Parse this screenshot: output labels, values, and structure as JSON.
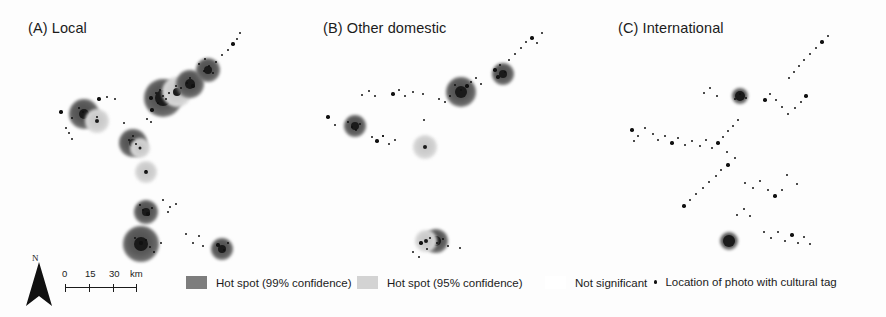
{
  "figure": {
    "type": "multi-panel-choropleth-hotspot-map",
    "panel_count": 3,
    "width": 886,
    "height": 317
  },
  "panels": [
    {
      "id": "A",
      "title": "(A) Local"
    },
    {
      "id": "B",
      "title": "(B) Other domestic"
    },
    {
      "id": "C",
      "title": "(C) International"
    }
  ],
  "north_arrow": {
    "label": "N"
  },
  "scale_bar": {
    "ticks": [
      "0",
      "15",
      "30"
    ],
    "unit": "km",
    "t0": "0",
    "t1": "15",
    "t2": "30"
  },
  "legend": {
    "hot99": "Hot spot (99% confidence)",
    "hot95": "Hot spot (95% confidence)",
    "not_significant": "Not significant",
    "photo_location": "Location of photo with cultural tag"
  },
  "colors": {
    "hot99": "#7d7d7d",
    "hot95": "#d3d3d3",
    "not_significant": "#ffffff",
    "point": "#111111",
    "text": "#1b1b1b",
    "background": "#fdfdfd"
  },
  "chart_data": {
    "type": "scatter",
    "xlabel": "",
    "ylabel": "",
    "legend_position": "bottom",
    "grid": false,
    "series": [
      {
        "name": "(A) Local",
        "hot_spots_99": [
          {
            "x": 80,
            "y": 110,
            "r": 15
          },
          {
            "x": 130,
            "y": 140,
            "r": 13
          },
          {
            "x": 165,
            "y": 95,
            "r": 20
          },
          {
            "x": 190,
            "y": 82,
            "r": 15
          },
          {
            "x": 207,
            "y": 70,
            "r": 13
          },
          {
            "x": 145,
            "y": 212,
            "r": 13
          },
          {
            "x": 140,
            "y": 243,
            "r": 19
          },
          {
            "x": 221,
            "y": 248,
            "r": 12
          }
        ],
        "hot_spots_95": [
          {
            "x": 96,
            "y": 117,
            "r": 12
          },
          {
            "x": 139,
            "y": 147,
            "r": 12
          },
          {
            "x": 179,
            "y": 90,
            "r": 14
          }
        ],
        "points_count": 48
      },
      {
        "name": "(B) Other domestic",
        "hot_spots_99": [
          {
            "x": 59,
            "y": 125,
            "r": 11
          },
          {
            "x": 165,
            "y": 92,
            "r": 15
          },
          {
            "x": 207,
            "y": 73,
            "r": 12
          },
          {
            "x": 140,
            "y": 240,
            "r": 13
          }
        ],
        "hot_spots_95": [
          {
            "x": 129,
            "y": 146,
            "r": 12
          },
          {
            "x": 131,
            "y": 240,
            "r": 12
          }
        ],
        "points_count": 40
      },
      {
        "name": "(C) International",
        "hot_spots_99": [
          {
            "x": 150,
            "y": 95,
            "r": 8
          },
          {
            "x": 138,
            "y": 240,
            "r": 8
          }
        ],
        "hot_spots_95": [],
        "points_count": 46
      }
    ],
    "categories": [
      "Hot spot (99% confidence)",
      "Hot spot (95% confidence)",
      "Not significant",
      "Location of photo with cultural tag"
    ]
  }
}
